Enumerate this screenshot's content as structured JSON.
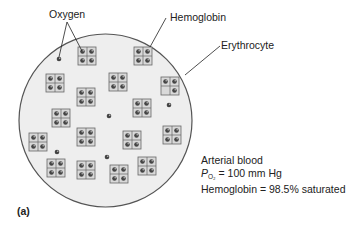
{
  "figure": {
    "panel_label": "(a)",
    "labels": {
      "oxygen": "Oxygen",
      "hemoglobin": "Hemoglobin",
      "erythrocyte": "Erythrocyte"
    },
    "info": {
      "line1": "Arterial blood",
      "po2_symbol": "P",
      "po2_subscript": "O₂",
      "po2_value": " = 100 mm Hg",
      "line3": "Hemoglobin = 98.5% saturated"
    },
    "colors": {
      "cell_fill": "#eeeeee",
      "cell_stroke": "#555555",
      "box_fill": "#d9d9d9",
      "box_stroke": "#666666",
      "oxygen_fill": "#444444"
    },
    "hemoglobin_molecules": [
      {
        "x": 78,
        "y": 47,
        "full": true
      },
      {
        "x": 134,
        "y": 47,
        "full": true
      },
      {
        "x": 46,
        "y": 74,
        "full": true
      },
      {
        "x": 109,
        "y": 73,
        "full": true
      },
      {
        "x": 161,
        "y": 77,
        "full": false
      },
      {
        "x": 77,
        "y": 88,
        "full": true
      },
      {
        "x": 133,
        "y": 99,
        "full": true
      },
      {
        "x": 52,
        "y": 109,
        "full": true
      },
      {
        "x": 77,
        "y": 128,
        "full": true
      },
      {
        "x": 29,
        "y": 133,
        "full": true
      },
      {
        "x": 123,
        "y": 131,
        "full": true
      },
      {
        "x": 163,
        "y": 126,
        "full": true
      },
      {
        "x": 47,
        "y": 159,
        "full": true
      },
      {
        "x": 138,
        "y": 157,
        "full": true
      },
      {
        "x": 77,
        "y": 161,
        "full": true
      },
      {
        "x": 110,
        "y": 165,
        "full": true
      }
    ],
    "free_oxygen": [
      {
        "x": 59,
        "y": 59
      },
      {
        "x": 109,
        "y": 116
      },
      {
        "x": 169,
        "y": 105
      },
      {
        "x": 57,
        "y": 152
      },
      {
        "x": 107,
        "y": 157
      }
    ]
  }
}
